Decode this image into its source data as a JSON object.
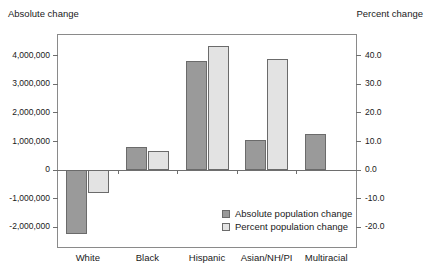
{
  "chart_data": {
    "type": "bar",
    "title": "",
    "subtitle": "",
    "categories": [
      "White",
      "Black",
      "Hispanic",
      "Asian/NH/PI",
      "Multiracial"
    ],
    "series": [
      {
        "name": "Absolute population change",
        "axis": "left",
        "color": "#9a9a9a",
        "values": [
          -2250000,
          800000,
          3800000,
          1050000,
          1250000
        ]
      },
      {
        "name": "Percent population change",
        "axis": "right",
        "color": "#e3e3e3",
        "values": [
          -8.0,
          6.5,
          43.0,
          38.5,
          null
        ]
      }
    ],
    "left_axis": {
      "label": "Absolute change",
      "ticks": [
        4000000,
        3000000,
        2000000,
        1000000,
        0,
        -1000000,
        -2000000
      ],
      "tick_labels": [
        "4,000,000",
        "3,000,000",
        "2,000,000",
        "1,000,000",
        "0",
        "-1,000,000",
        "-2,000,000"
      ],
      "ylim": [
        -2700000,
        4700000
      ]
    },
    "right_axis": {
      "label": "Percent change",
      "ticks": [
        40.0,
        30.0,
        20.0,
        10.0,
        0.0,
        -10.0,
        -20.0
      ],
      "tick_labels": [
        "40.0",
        "30.0",
        "20.0",
        "10.0",
        "0.0",
        "-10.0",
        "-20.0"
      ],
      "ylim": [
        -27.0,
        47.0
      ]
    },
    "legend": {
      "position": "inside-bottom-right",
      "entries": [
        {
          "label": "Absolute population change",
          "color": "#9a9a9a"
        },
        {
          "label": "Percent population change",
          "color": "#e3e3e3"
        }
      ]
    },
    "grid": false,
    "xlabel": "",
    "ylabel": "Absolute change"
  }
}
